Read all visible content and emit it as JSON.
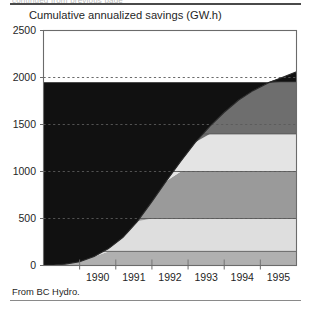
{
  "figure": {
    "clipped_top_caption": "continued from previous page",
    "source_note": "From BC Hydro."
  },
  "chart_data": {
    "type": "area",
    "stacked": true,
    "title": "Cumulative annualized savings (GW.h)",
    "xlabel": "",
    "ylabel": "",
    "ylim": [
      0,
      2500
    ],
    "xlim": [
      1989.0,
      1996.0
    ],
    "grid": true,
    "grid_style": "dashed-horizontal",
    "legend": "none",
    "yticks": [
      0,
      500,
      1000,
      1500,
      2000,
      2500
    ],
    "ytick_labels": [
      "0",
      "500",
      "1000",
      "1500",
      "2000",
      "2500"
    ],
    "xticks": [
      1990,
      1991,
      1992,
      1993,
      1994,
      1995
    ],
    "xtick_labels": [
      "1990",
      "1991",
      "1992",
      "1993",
      "1994",
      "1995"
    ],
    "x": [
      1989.0,
      1989.3,
      1989.6,
      1990.0,
      1990.4,
      1990.8,
      1991.2,
      1991.6,
      1992.0,
      1992.4,
      1992.8,
      1993.2,
      1993.6,
      1994.0,
      1994.4,
      1994.8,
      1995.2,
      1995.6,
      1996.0
    ],
    "total": [
      0,
      5,
      15,
      40,
      95,
      180,
      300,
      470,
      680,
      900,
      1110,
      1310,
      1480,
      1630,
      1760,
      1860,
      1940,
      2000,
      2060
    ],
    "series": [
      {
        "name": "band-1",
        "color": "#b0b0b0",
        "top_value": 150
      },
      {
        "name": "band-2",
        "color": "#dedede",
        "top_value": 500
      },
      {
        "name": "band-3",
        "color": "#9a9a9a",
        "top_value": 1000
      },
      {
        "name": "band-4",
        "color": "#e4e4e4",
        "top_value": 1400
      },
      {
        "name": "band-5",
        "color": "#6e6e6e",
        "top_value": 1950
      },
      {
        "name": "band-6",
        "color": "#111111",
        "top_value": 2500
      }
    ],
    "colors": {
      "axis": "#6b6b6b",
      "grid": "#5a5a5a",
      "outline": "#2a2a2a",
      "plot_background": "#ffffff"
    }
  }
}
